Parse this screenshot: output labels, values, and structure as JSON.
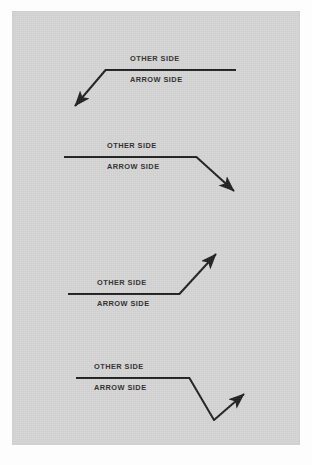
{
  "page": {
    "background_color": "#fdfdfd",
    "plate_color": "#d3d3d3",
    "line_color": "#1c1c1c",
    "text_color": "#2b2b2b"
  },
  "figures": [
    {
      "id": "figure-1",
      "description": "Reference line with arrow breaking downward to the left",
      "other_side_label": "OTHER SIDE",
      "arrow_side_label": "ARROW SIDE",
      "arrow_direction": "down-left"
    },
    {
      "id": "figure-2",
      "description": "Reference line with arrow breaking downward to the right",
      "other_side_label": "OTHER SIDE",
      "arrow_side_label": "ARROW SIDE",
      "arrow_direction": "down-right"
    },
    {
      "id": "figure-3",
      "description": "Reference line with arrow breaking upward to the right",
      "other_side_label": "OTHER SIDE",
      "arrow_side_label": "ARROW SIDE",
      "arrow_direction": "up-right"
    },
    {
      "id": "figure-4",
      "description": "Reference line with bent (doubled) arrow going down then up to the right",
      "other_side_label": "OTHER SIDE",
      "arrow_side_label": "ARROW SIDE",
      "arrow_direction": "bent-down-then-up-right"
    }
  ]
}
